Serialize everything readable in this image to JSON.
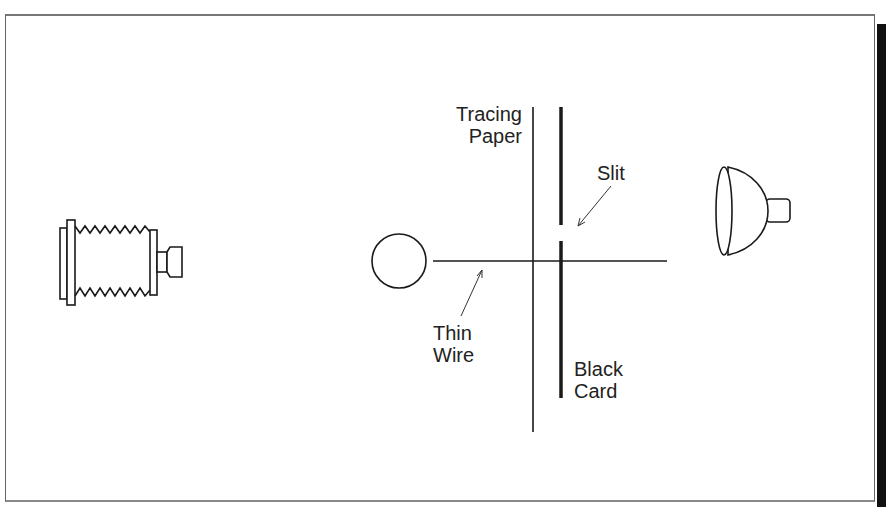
{
  "diagram": {
    "type": "optical-setup",
    "components": [
      {
        "id": "camera",
        "label": "",
        "icon": "bellows-camera-icon"
      },
      {
        "id": "sphere",
        "label": "",
        "icon": "circle-object"
      },
      {
        "id": "wire",
        "label": "Thin Wire"
      },
      {
        "id": "tracing-paper",
        "label": "Tracing Paper"
      },
      {
        "id": "black-card",
        "label": "Black Card"
      },
      {
        "id": "slit",
        "label": "Slit"
      },
      {
        "id": "lamp",
        "label": "",
        "icon": "lamp-reflector-icon"
      }
    ]
  },
  "labels": {
    "tracing_paper_line1": "Tracing",
    "tracing_paper_line2": "Paper",
    "slit": "Slit",
    "thin_wire_line1": "Thin",
    "thin_wire_line2": "Wire",
    "black_card_line1": "Black",
    "black_card_line2": "Card"
  },
  "colors": {
    "ink": "#1a1a1a",
    "background": "#ffffff"
  }
}
